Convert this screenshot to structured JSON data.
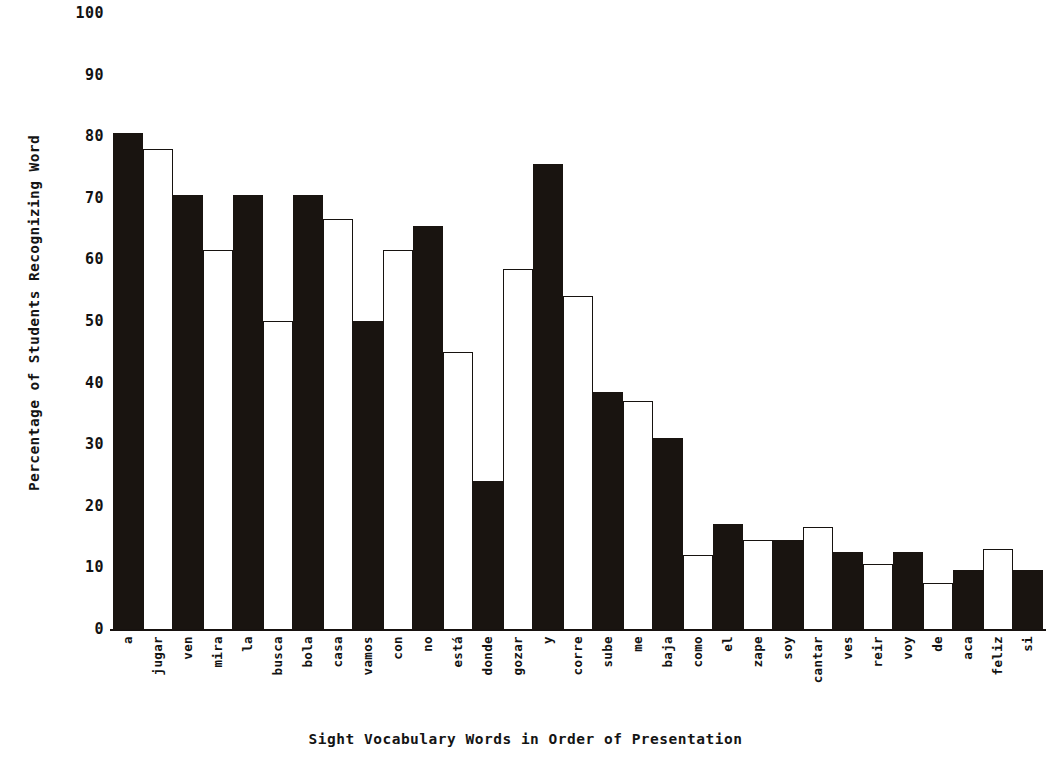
{
  "chart_data": {
    "type": "bar",
    "title": "",
    "xlabel": "Sight Vocabulary Words in Order of Presentation",
    "ylabel": "Percentage of Students Recognizing Word",
    "ylim": [
      0,
      100
    ],
    "yticks": [
      100,
      90,
      80,
      70,
      60,
      50,
      40,
      30,
      20,
      10,
      0
    ],
    "grid": false,
    "legend": null,
    "bar_style_note": "bars alternate between solid black fill and white fill with black outline",
    "colors": {
      "filled": "#191410",
      "open_fill": "#ffffff",
      "outline": "#171310",
      "axis": "#17120f",
      "text": "#131313",
      "background": "#ffffff"
    },
    "categories": [
      "a",
      "jugar",
      "ven",
      "mira",
      "la",
      "busca",
      "bola",
      "casa",
      "vamos",
      "con",
      "no",
      "está",
      "donde",
      "gozar",
      "y",
      "corre",
      "sube",
      "me",
      "baja",
      "como",
      "el",
      "zape",
      "soy",
      "cantar",
      "ves",
      "reir",
      "voy",
      "de",
      "aca",
      "feliz",
      "si"
    ],
    "values": [
      80.5,
      78,
      70.5,
      61.5,
      70.5,
      50,
      70.5,
      66.5,
      50,
      61.5,
      65.5,
      45,
      24,
      58.5,
      75.5,
      54,
      38.5,
      37,
      31,
      12,
      17,
      14.5,
      14.5,
      16.5,
      12.5,
      10.5,
      12.5,
      7.5,
      9.5,
      13,
      9.5
    ],
    "styles": [
      "filled",
      "open",
      "filled",
      "open",
      "filled",
      "open",
      "filled",
      "open",
      "filled",
      "open",
      "filled",
      "open",
      "filled",
      "open",
      "filled",
      "open",
      "filled",
      "open",
      "filled",
      "open",
      "filled",
      "open",
      "filled",
      "open",
      "filled",
      "open",
      "filled",
      "open",
      "filled",
      "open",
      "filled"
    ]
  }
}
